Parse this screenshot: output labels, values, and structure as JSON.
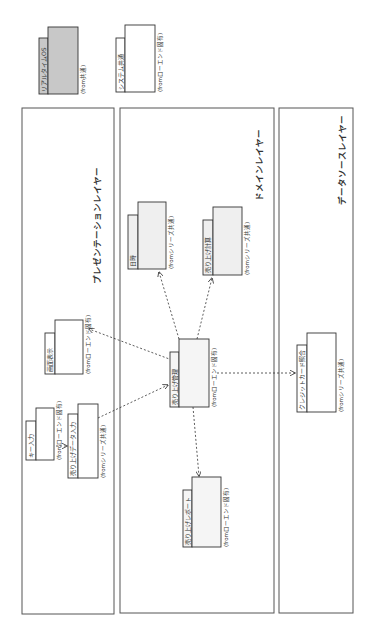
{
  "diagram": {
    "orientation": "rotated-90-ccw",
    "legend": [
      {
        "name": "リアルタイムOS",
        "origin": "(from共通)",
        "style": "gray"
      },
      {
        "name": "システム共通",
        "origin": "(fromローエンド固有)",
        "style": "white"
      }
    ],
    "layers": [
      {
        "id": "presentation",
        "label": "プレゼンテーションレイヤー"
      },
      {
        "id": "domain",
        "label": "ドメインレイヤー"
      },
      {
        "id": "datasource",
        "label": "データソースレイヤー"
      }
    ],
    "packages": [
      {
        "id": "gamen",
        "name": "画面表示",
        "origin": "(fromローエンド固有)",
        "layer": "presentation"
      },
      {
        "id": "key",
        "name": "キー入力",
        "origin": "(fromローエンド固有)",
        "layer": "presentation"
      },
      {
        "id": "uriage_input",
        "name": "売り上げデータ入力",
        "origin": "(fromシリーズ共通)",
        "layer": "presentation"
      },
      {
        "id": "nichiji",
        "name": "日時",
        "origin": "(fromシリーズ共通)",
        "layer": "domain"
      },
      {
        "id": "keisan",
        "name": "売り上げ計算",
        "origin": "(fromシリーズ共通)",
        "layer": "domain"
      },
      {
        "id": "kanri",
        "name": "売り上げ管理",
        "origin": "(fromローエンド固有)",
        "layer": "domain"
      },
      {
        "id": "report",
        "name": "売り上げレポート",
        "origin": "(fromローエンド固有)",
        "layer": "domain"
      },
      {
        "id": "credit",
        "name": "クレジットカード照合",
        "origin": "(fromシリーズ共通)",
        "layer": "datasource"
      }
    ],
    "dependencies": [
      {
        "from": "key",
        "to": "uriage_input"
      },
      {
        "from": "uriage_input",
        "to": "kanri"
      },
      {
        "from": "kanri",
        "to": "gamen"
      },
      {
        "from": "kanri",
        "to": "nichiji"
      },
      {
        "from": "kanri",
        "to": "keisan"
      },
      {
        "from": "kanri",
        "to": "report"
      },
      {
        "from": "kanri",
        "to": "credit"
      }
    ]
  }
}
